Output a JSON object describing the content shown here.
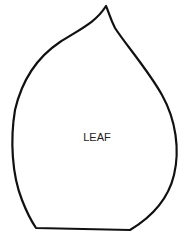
{
  "diagram": {
    "shape": "leaf-outline",
    "label": "LEAF",
    "stroke_color": "#111111",
    "fill_color": "#ffffff"
  }
}
